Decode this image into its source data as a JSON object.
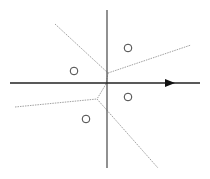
{
  "diagram": {
    "type": "voronoi-partition",
    "axes": {
      "horizontal": {
        "x1": 10,
        "y1": 83,
        "x2": 200,
        "y2": 83,
        "color": "#222222",
        "arrow": true
      },
      "vertical": {
        "x1": 107,
        "y1": 10,
        "x2": 107,
        "y2": 168,
        "color": "#555555"
      }
    },
    "points": [
      {
        "x": 128,
        "y": 48
      },
      {
        "x": 74,
        "y": 71
      },
      {
        "x": 128,
        "y": 97
      },
      {
        "x": 86,
        "y": 119
      }
    ],
    "boundaries": [
      {
        "x1": 55,
        "y1": 24,
        "x2": 108,
        "y2": 73
      },
      {
        "x1": 108,
        "y1": 73,
        "x2": 191,
        "y2": 45
      },
      {
        "x1": 108,
        "y1": 73,
        "x2": 106,
        "y2": 84
      },
      {
        "x1": 106,
        "y1": 84,
        "x2": 97,
        "y2": 99
      },
      {
        "x1": 15,
        "y1": 107,
        "x2": 97,
        "y2": 99
      },
      {
        "x1": 97,
        "y1": 99,
        "x2": 158,
        "y2": 168
      }
    ],
    "colors": {
      "boundary": "#888888",
      "point": "#444444"
    }
  }
}
